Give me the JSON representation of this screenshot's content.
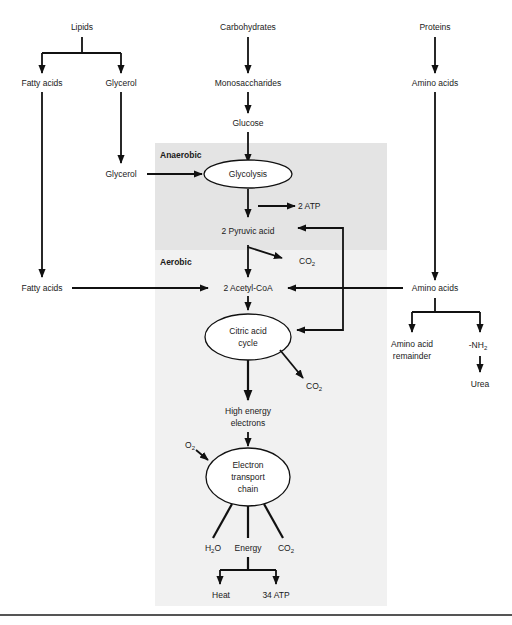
{
  "diagram": {
    "regions": {
      "anaerobic": "Anaerobic",
      "aerobic": "Aerobic"
    },
    "colors": {
      "anaerobic_bg": "#e4e4e4",
      "aerobic_bg": "#f1f1f1",
      "line": "#111111",
      "text": "#1a1a1a",
      "bottom_rule": "#555555"
    },
    "nodes": {
      "lipids": "Lipids",
      "carbohydrates": "Carbohydrates",
      "proteins": "Proteins",
      "fatty_acids_top": "Fatty acids",
      "glycerol_top": "Glycerol",
      "monosaccharides": "Monosaccharides",
      "amino_acids_top": "Amino acids",
      "glucose": "Glucose",
      "glycerol_mid": "Glycerol",
      "glycolysis": "Glycolysis",
      "atp_2": "2 ATP",
      "pyruvic_acid": "2 Pyruvic acid",
      "co2_pyruvate": "CO",
      "fatty_acids_mid": "Fatty acids",
      "acetyl_coa": "2 Acetyl-CoA",
      "amino_acids_mid": "Amino acids",
      "citric_line1": "Citric acid",
      "citric_line2": "cycle",
      "amino_remainder_line1": "Amino acid",
      "amino_remainder_line2": "remainder",
      "nh2": "-NH",
      "urea": "Urea",
      "co2_citric": "CO",
      "high_energy_line1": "High energy",
      "high_energy_line2": "electrons",
      "o2": "O",
      "etc_line1": "Electron",
      "etc_line2": "transport",
      "etc_line3": "chain",
      "h2o_h": "H",
      "h2o_o": "O",
      "energy": "Energy",
      "co2_etc": "CO",
      "heat": "Heat",
      "atp_34": "34 ATP",
      "subscript_2": "2"
    }
  }
}
